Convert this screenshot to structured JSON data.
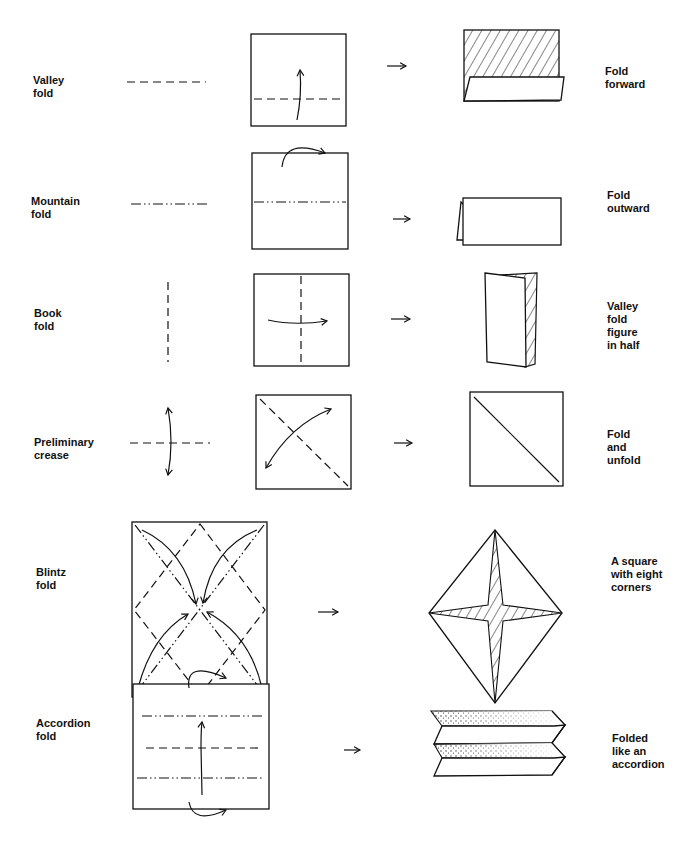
{
  "rows": [
    {
      "name": "Valley fold",
      "left_label": "Valley\nfold",
      "result_label": "Fold\nforward"
    },
    {
      "name": "Mountain fold",
      "left_label": "Mountain\nfold",
      "result_label": "Fold\noutward"
    },
    {
      "name": "Book fold",
      "left_label": "Book\nfold",
      "result_label": "Valley\nfold\nfigure\nin half"
    },
    {
      "name": "Preliminary crease",
      "left_label": "Preliminary\ncrease",
      "result_label": "Fold\nand\nunfold"
    },
    {
      "name": "Blintz fold",
      "left_label": "Blintz\nfold",
      "result_label": "A square\nwith eight\ncorners"
    },
    {
      "name": "Accordion fold",
      "left_label": "Accordion\nfold",
      "result_label": "Folded\nlike an\naccordion"
    }
  ],
  "icons": {
    "step_arrow": "right-arrow",
    "fold_arrow": "curved-arrow"
  },
  "colors": {
    "ink": "#111111",
    "paper": "#ffffff"
  }
}
